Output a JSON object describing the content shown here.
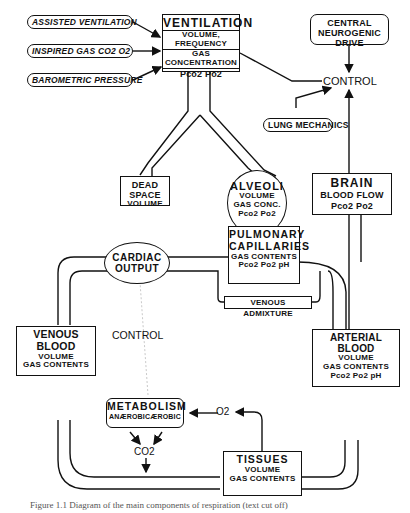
{
  "diagram": {
    "inputs": [
      {
        "id": "assisted",
        "label": "ASSISTED VENTILATION"
      },
      {
        "id": "inspired",
        "label": "INSPIRED GAS  CO2  O2"
      },
      {
        "id": "barometric",
        "label": "BAROMETRIC PRESSURE"
      }
    ],
    "ventilation": {
      "title": "VENTILATION",
      "line1": "VOLUME, FREQUENCY",
      "line2": "GAS CONCENTRATION",
      "line3": "Pco2  Po2"
    },
    "central_drive": {
      "line1": "CENTRAL",
      "line2": "NEUROGENIC DRIVE"
    },
    "control_top": "CONTROL",
    "lung_mechanics": "LUNG MECHANICS",
    "dead_space": {
      "title": "DEAD SPACE",
      "line1": "VOLUME"
    },
    "alveoli": {
      "title": "ALVEOLI",
      "line1": "VOLUME",
      "line2": "GAS CONC.",
      "line3": "Pco2  Po2"
    },
    "brain": {
      "title": "BRAIN",
      "line1": "BLOOD FLOW",
      "line2": "Pco2  Po2"
    },
    "cardiac_output": {
      "line1": "CARDIAC",
      "line2": "OUTPUT"
    },
    "pulmonary": {
      "title1": "PULMONARY",
      "title2": "CAPILLARIES",
      "line1": "GAS CONTENTS",
      "line2": "Pco2  Po2  pH"
    },
    "venous_admixture": "VENOUS ADMIXTURE",
    "control_mid": "CONTROL",
    "venous_blood": {
      "title": "VENOUS BLOOD",
      "line1": "VOLUME",
      "line2": "GAS CONTENTS"
    },
    "arterial_blood": {
      "title": "ARTERIAL BLOOD",
      "line1": "VOLUME",
      "line2": "GAS CONTENTS",
      "line3": "Pco2  Po2   pH"
    },
    "metabolism": {
      "title": "METABOLISM",
      "left": "ANÆROBIC",
      "right": "ÆROBIC"
    },
    "o2_label": "O2",
    "co2_label": "CO2",
    "tissues": {
      "title": "TISSUES",
      "line1": "VOLUME",
      "line2": "GAS CONTENTS"
    },
    "caption": "Figure 1.1 Diagram of the main components of respiration (text cut off)"
  }
}
